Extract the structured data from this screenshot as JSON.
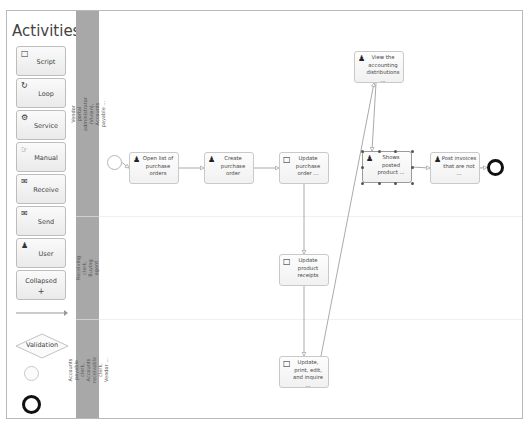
{
  "palette": {
    "title": "Activities",
    "items": [
      {
        "label": "Script",
        "icon": "script-icon",
        "glyph": "□"
      },
      {
        "label": "Loop",
        "icon": "loop-icon",
        "glyph": "↻"
      },
      {
        "label": "Service",
        "icon": "gear-icon",
        "glyph": "⚙"
      },
      {
        "label": "Manual",
        "icon": "hand-icon",
        "glyph": "☞"
      },
      {
        "label": "Receive",
        "icon": "envelope-open-icon",
        "glyph": "✉"
      },
      {
        "label": "Send",
        "icon": "envelope-filled-icon",
        "glyph": "✉"
      },
      {
        "label": "User",
        "icon": "user-icon",
        "glyph": "♟"
      }
    ],
    "collapsed": {
      "label": "Collapsed",
      "plus": "+"
    },
    "validation_label": "Validation"
  },
  "lanes": [
    {
      "label": "Vendor portal administrator (Vivian), Accounts payable ..."
    },
    {
      "label": "Receiving clerk, Buying agent"
    },
    {
      "label": "Accounts payable clerk, Accounts receivable clerk, Vendor ..."
    }
  ],
  "tasks": [
    {
      "id": "t1",
      "text": "Open list of purchase orders",
      "type": "user"
    },
    {
      "id": "t2",
      "text": "Create purchase order",
      "type": "user"
    },
    {
      "id": "t3",
      "text": "Update purchase order ...",
      "type": "script"
    },
    {
      "id": "t4",
      "text": "View the accounting distributions ...",
      "type": "user"
    },
    {
      "id": "t5",
      "text": "Shows posted product ...",
      "type": "user",
      "selected": true
    },
    {
      "id": "t6",
      "text": "Post invoices that are not ...",
      "type": "user"
    },
    {
      "id": "t7",
      "text": "Update product receipts",
      "type": "script"
    },
    {
      "id": "t8",
      "text": "Update, print, edit, and inquire ...",
      "type": "script"
    }
  ],
  "flows": [
    [
      "start",
      "t1"
    ],
    [
      "t1",
      "t2"
    ],
    [
      "t2",
      "t3"
    ],
    [
      "t3",
      "t7"
    ],
    [
      "t7",
      "t8"
    ],
    [
      "t8",
      "t4"
    ],
    [
      "t4",
      "t5"
    ],
    [
      "t5",
      "t6"
    ],
    [
      "t6",
      "end"
    ]
  ]
}
